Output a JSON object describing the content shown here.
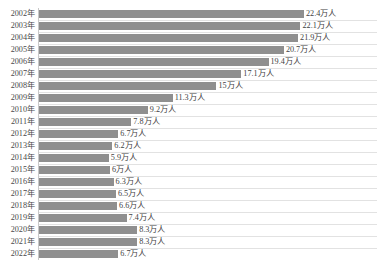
{
  "chart_data": {
    "type": "bar",
    "orientation": "horizontal",
    "title": "",
    "xlabel": "",
    "ylabel": "",
    "unit": "万人",
    "categories": [
      "2002年",
      "2003年",
      "2004年",
      "2005年",
      "2006年",
      "2007年",
      "2008年",
      "2009年",
      "2010年",
      "2011年",
      "2012年",
      "2013年",
      "2014年",
      "2015年",
      "2016年",
      "2017年",
      "2018年",
      "2019年",
      "2020年",
      "2021年",
      "2022年"
    ],
    "values": [
      22.4,
      22.1,
      21.9,
      20.7,
      19.4,
      17.1,
      15,
      11.3,
      9.2,
      7.8,
      6.7,
      6.2,
      5.9,
      6,
      6.3,
      6.5,
      6.6,
      7.4,
      8.3,
      8.3,
      6.7
    ],
    "value_labels": [
      "22.4万人",
      "22.1万人",
      "21.9万人",
      "20.7万人",
      "19.4万人",
      "17.1万人",
      "15万人",
      "11.3万人",
      "9.2万人",
      "7.8万人",
      "6.7万人",
      "6.2万人",
      "5.9万人",
      "6万人",
      "6.3万人",
      "6.5万人",
      "6.6万人",
      "7.4万人",
      "8.3万人",
      "8.3万人",
      "6.7万人"
    ],
    "xlim": [
      0,
      22.4
    ],
    "grid": false,
    "legend": null,
    "bar_color": "#8f8f8f",
    "axis_color": "#c8c8c8",
    "background": "#ffffff"
  }
}
